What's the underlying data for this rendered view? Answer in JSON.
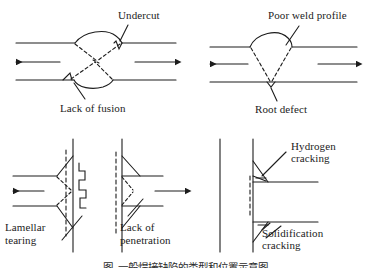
{
  "figure": {
    "background_color": "#ffffff",
    "line_color": "#1c1c1c",
    "text_color": "#1c1c1c",
    "width": 371,
    "height": 268
  },
  "panels": [
    {
      "id": "panel-top-left",
      "joint_type": "double-V butt weld (X joint)",
      "labels": [
        {
          "key": "undercut",
          "text": "Undercut"
        },
        {
          "key": "lack_of_fusion",
          "text": "Lack of fusion"
        }
      ]
    },
    {
      "id": "panel-top-right",
      "joint_type": "single-V butt weld",
      "labels": [
        {
          "key": "poor_weld_profile",
          "text": "Poor weld profile"
        },
        {
          "key": "root_defect",
          "text": "Root defect"
        }
      ]
    },
    {
      "id": "panel-bottom-left",
      "joint_type": "T joint / cruciform weld",
      "labels": [
        {
          "key": "lamellar_tearing",
          "line1": "Lamellar",
          "line2": "tearing"
        }
      ]
    },
    {
      "id": "panel-bottom-mid",
      "joint_type": "T joint double fillet weld",
      "labels": [
        {
          "key": "lack_of_penetration",
          "line1": "Lack of",
          "line2": "penetration"
        }
      ]
    },
    {
      "id": "panel-bottom-right",
      "joint_type": "fillet welds on vertical plate",
      "labels": [
        {
          "key": "hydrogen_cracking",
          "line1": "Hydrogen",
          "line2": "cracking"
        },
        {
          "key": "solidification_cracking",
          "line1": "Solidification",
          "line2": "cracking"
        }
      ]
    }
  ],
  "labels": {
    "undercut": "Undercut",
    "lack_of_fusion": "Lack of fusion",
    "poor_weld_profile": "Poor weld profile",
    "root_defect": "Root defect",
    "lamellar_tearing_l1": "Lamellar",
    "lamellar_tearing_l2": "tearing",
    "lack_of_penetration_l1": "Lack of",
    "lack_of_penetration_l2": "penetration",
    "hydrogen_cracking_l1": "Hydrogen",
    "hydrogen_cracking_l2": "cracking",
    "solidification_cracking_l1": "Solidification",
    "solidification_cracking_l2": "cracking"
  },
  "caption": {
    "text": "图  一般焊接缺陷的类型和位置示意图",
    "note": "caption is clipped by the bottom edge of the screenshot"
  }
}
